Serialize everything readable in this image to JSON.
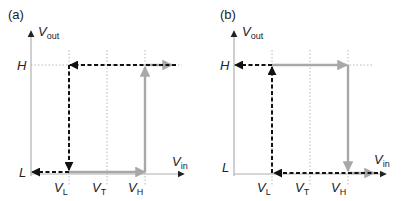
{
  "panels": [
    {
      "id": "a",
      "label": "(a)",
      "y_axis_label": "V",
      "y_axis_sub": "out",
      "x_axis_label": "V",
      "x_axis_sub": "in",
      "levels": {
        "high": "H",
        "low": "L"
      },
      "thresholds": [
        {
          "name": "V",
          "sub": "L"
        },
        {
          "name": "V",
          "sub": "T"
        },
        {
          "name": "V",
          "sub": "H"
        }
      ],
      "paths": {
        "rising": "gray solid: L from VL to VH, then up to H, then right",
        "falling": "black dashed: H from right to VL, then down to L, then left"
      }
    },
    {
      "id": "b",
      "label": "(b)",
      "y_axis_label": "V",
      "y_axis_sub": "out",
      "x_axis_label": "V",
      "x_axis_sub": "in",
      "levels": {
        "high": "H",
        "low": "L"
      },
      "thresholds": [
        {
          "name": "V",
          "sub": "L"
        },
        {
          "name": "V",
          "sub": "T"
        },
        {
          "name": "V",
          "sub": "H"
        }
      ],
      "paths": {
        "rising": "gray solid: H from VL to VH, then down to L, then right",
        "falling": "black dashed: L from right to VL, then up to H, then left"
      }
    }
  ],
  "colors": {
    "axis": "#b0b0b0",
    "grid": "#b8b8b8",
    "gray_path": "#a8a8a8",
    "black_path": "#111111",
    "text": "#222222"
  }
}
